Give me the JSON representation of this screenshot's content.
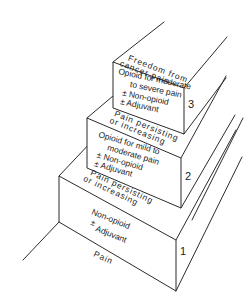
{
  "diagram": {
    "ground_label": "Pain",
    "steps": [
      {
        "number": "1",
        "lines": [
          "Non-opioid",
          "±",
          "Adjuvant"
        ]
      },
      {
        "number": "2",
        "lines": [
          "Opioid for mild to",
          "moderate pain",
          "± Non-opioid",
          "± Adjuvant"
        ]
      },
      {
        "number": "3",
        "lines": [
          "Opioid for moderate",
          "to severe pain",
          "± Non-opioid",
          "± Adjuvant"
        ]
      }
    ],
    "transitions": [
      {
        "line1": "Pain persisting",
        "line2": "or increasing"
      },
      {
        "line1": "Pain persisting",
        "line2": "or increasing"
      }
    ],
    "top_label": {
      "line1": "Freedom from",
      "line2": "cancer pain"
    },
    "colors": {
      "line": "#2b2b2b",
      "text": "#222222",
      "background": "#ffffff"
    }
  }
}
